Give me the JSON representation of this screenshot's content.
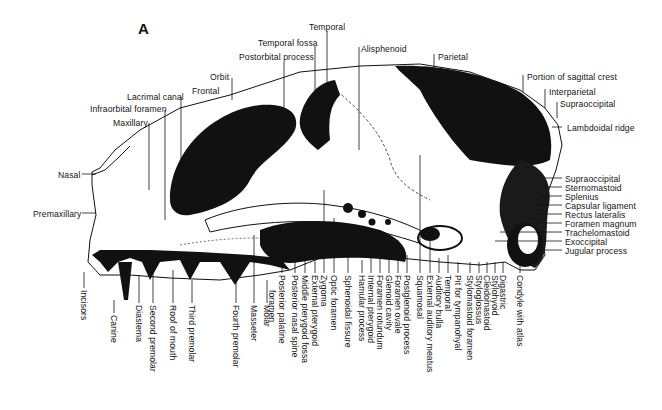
{
  "figure": {
    "panel_label": "A",
    "colors": {
      "ink": "#111111",
      "background": "#ffffff",
      "bone": "#ffffff"
    }
  },
  "labels": {
    "top": [
      {
        "id": "temporal-top",
        "text": "Temporal",
        "x": 309,
        "y": 22,
        "lx": 327,
        "ly1": 31,
        "ly2": 135
      },
      {
        "id": "temporal-fossa",
        "text": "Temporal fossa",
        "x": 258,
        "y": 38,
        "lx": 315,
        "ly1": 46,
        "ly2": 136
      },
      {
        "id": "postorbital-process",
        "text": "Postorbital process",
        "x": 239,
        "y": 52,
        "lx": 284,
        "ly1": 62,
        "ly2": 140
      },
      {
        "id": "alisphenoid",
        "text": "Alisphenoid",
        "x": 361,
        "y": 44,
        "lx": 359,
        "ly1": 47,
        "ly2": 150
      },
      {
        "id": "parietal",
        "text": "Parietal",
        "x": 438,
        "y": 52,
        "lx": 434,
        "ly1": 54,
        "ly2": 68
      },
      {
        "id": "orbit",
        "text": "Orbit",
        "x": 210,
        "y": 72,
        "lx": 232,
        "ly1": 78,
        "ly2": 100
      },
      {
        "id": "frontal",
        "text": "Frontal",
        "x": 192,
        "y": 86
      },
      {
        "id": "lacrimal-canal",
        "text": "Lacrimal canal",
        "x": 127,
        "y": 92,
        "lx": 181,
        "ly1": 97,
        "ly2": 205
      },
      {
        "id": "infraorbital-foramen",
        "text": "Infraorbital foramen",
        "x": 90,
        "y": 104,
        "lx": 165,
        "ly1": 110,
        "ly2": 220
      },
      {
        "id": "maxillary",
        "text": "Maxillary",
        "x": 113,
        "y": 118,
        "lx": 149,
        "ly1": 123,
        "ly2": 190
      }
    ],
    "right_upper": [
      {
        "id": "portion-sagittal-crest",
        "text": "Portion of sagittal crest",
        "x": 527,
        "y": 72,
        "lx": 523,
        "ly1": 75,
        "ly2": 92
      },
      {
        "id": "interparietal",
        "text": "Interparietal",
        "x": 549,
        "y": 87,
        "lx": 545,
        "ly1": 89,
        "ly2": 108
      },
      {
        "id": "supraoccipital-top",
        "text": "Supraoccipital",
        "x": 560,
        "y": 99,
        "lx": 557,
        "ly1": 102,
        "ly2": 118
      },
      {
        "id": "lambdoidal-ridge",
        "text": "Lambdoidal ridge",
        "x": 567,
        "y": 123,
        "lx": 560,
        "ly1": 127,
        "ly2": 127
      }
    ],
    "left": [
      {
        "id": "nasal",
        "text": "Nasal",
        "x": 58,
        "y": 170
      },
      {
        "id": "premaxillary",
        "text": "Premaxillary",
        "x": 33,
        "y": 209
      }
    ],
    "right_stack": [
      {
        "id": "supraoccipital",
        "text": "Supraoccipital",
        "x": 565,
        "y": 174
      },
      {
        "id": "sternomastoid",
        "text": "Sternomastoid",
        "x": 565,
        "y": 183
      },
      {
        "id": "splenius",
        "text": "Splenius",
        "x": 565,
        "y": 192
      },
      {
        "id": "capsular-ligament",
        "text": "Capsular ligament",
        "x": 565,
        "y": 201
      },
      {
        "id": "rectus-lateralis",
        "text": "Rectus lateralis",
        "x": 565,
        "y": 210
      },
      {
        "id": "foramen-magnum",
        "text": "Foramen magnum",
        "x": 565,
        "y": 219
      },
      {
        "id": "trachelomastoid",
        "text": "Trachelomastoid",
        "x": 565,
        "y": 228
      },
      {
        "id": "exoccipital",
        "text": "Exoccipital",
        "x": 565,
        "y": 237
      },
      {
        "id": "jugular-process",
        "text": "Jugular process",
        "x": 565,
        "y": 246
      }
    ],
    "bottom": [
      {
        "id": "incisors",
        "text": "Incisors",
        "x": 82,
        "y": 290,
        "ly1": 272
      },
      {
        "id": "canine",
        "text": "Canine",
        "x": 112,
        "y": 315,
        "ly1": 300
      },
      {
        "id": "diastema",
        "text": "Diastema",
        "x": 137,
        "y": 305,
        "ly1": 275
      },
      {
        "id": "second-premolar",
        "text": "Second premolar",
        "x": 151,
        "y": 305,
        "ly1": 268
      },
      {
        "id": "roof-of-mouth",
        "text": "Roof of mouth",
        "x": 171,
        "y": 305,
        "ly1": 270
      },
      {
        "id": "third-premolar",
        "text": "Third premolar",
        "x": 190,
        "y": 305,
        "ly1": 280
      },
      {
        "id": "fourth-premolar",
        "text": "Fourth premolar",
        "x": 234,
        "y": 305,
        "ly1": 280
      },
      {
        "id": "masseter",
        "text": "Masseter",
        "x": 252,
        "y": 305,
        "ly1": 235
      },
      {
        "id": "molar",
        "text": "Molar",
        "x": 265,
        "y": 305,
        "ly1": 280
      },
      {
        "id": "posterior-palatine-foramen",
        "text": "Posterior palatine",
        "text2": "foramen",
        "x": 280,
        "y": 275,
        "ly1": 262
      },
      {
        "id": "posterior-nasal-spine",
        "text": "Posterior nasal spine",
        "x": 293,
        "y": 275,
        "ly1": 260
      },
      {
        "id": "middle-pterygoid-fossa",
        "text": "Middle pterygoid fossa",
        "x": 303,
        "y": 275,
        "ly1": 245
      },
      {
        "id": "external-pterygoid",
        "text": "External pterygoid",
        "x": 313,
        "y": 275,
        "ly1": 240
      },
      {
        "id": "zygoma",
        "text": "Zygoma",
        "x": 322,
        "y": 275,
        "ly1": 190
      },
      {
        "id": "optic-foramen",
        "text": "Optic foramen",
        "x": 332,
        "y": 275,
        "ly1": 218
      },
      {
        "id": "sphenoidal-fissure",
        "text": "Sphenoidal fissure",
        "x": 346,
        "y": 275,
        "ly1": 225
      },
      {
        "id": "hamular-process",
        "text": "Hamular process",
        "x": 360,
        "y": 275,
        "ly1": 260
      },
      {
        "id": "internal-pterygoid",
        "text": "Internal pterygoid",
        "x": 369,
        "y": 275,
        "ly1": 248
      },
      {
        "id": "foramen-rotundum",
        "text": "Foramen rotundum",
        "x": 378,
        "y": 275,
        "ly1": 230
      },
      {
        "id": "glenoid-cavity",
        "text": "Glenoid cavity",
        "x": 387,
        "y": 275,
        "ly1": 250
      },
      {
        "id": "foramen-ovale",
        "text": "Foramen ovale",
        "x": 396,
        "y": 275,
        "ly1": 240
      },
      {
        "id": "postglenoid-process",
        "text": "Postglenoid process",
        "x": 405,
        "y": 275,
        "ly1": 255
      },
      {
        "id": "squamosal",
        "text": "Squamosal",
        "x": 418,
        "y": 275,
        "ly1": 155
      },
      {
        "id": "external-auditory-meatus",
        "text": "External auditory meatus",
        "x": 428,
        "y": 275,
        "ly1": 240
      },
      {
        "id": "auditory-bulla",
        "text": "Auditory bulla",
        "x": 437,
        "y": 275,
        "ly1": 258
      },
      {
        "id": "temporal-bottom",
        "text": "Temporal",
        "x": 446,
        "y": 275,
        "ly1": 255
      },
      {
        "id": "pit-for-tympanohyal",
        "text": "Pit for tympanohyal",
        "x": 456,
        "y": 275,
        "ly1": 262
      },
      {
        "id": "stylomastoid-foramen",
        "text": "Stylomastoid foramen",
        "x": 468,
        "y": 275,
        "ly1": 262
      },
      {
        "id": "styloglossus",
        "text": "Styloglossus",
        "x": 477,
        "y": 275,
        "ly1": 262
      },
      {
        "id": "cleidomastoid",
        "text": "Cleidomastoid",
        "x": 485,
        "y": 275,
        "ly1": 262
      },
      {
        "id": "stylohyoid",
        "text": "Stylohyoid",
        "x": 493,
        "y": 275,
        "ly1": 262
      },
      {
        "id": "digastric",
        "text": "Digastric",
        "x": 501,
        "y": 275,
        "ly1": 262
      },
      {
        "id": "condyle-with-atlas",
        "text": "Condyle with atlas",
        "x": 518,
        "y": 275,
        "ly1": 262
      }
    ]
  }
}
